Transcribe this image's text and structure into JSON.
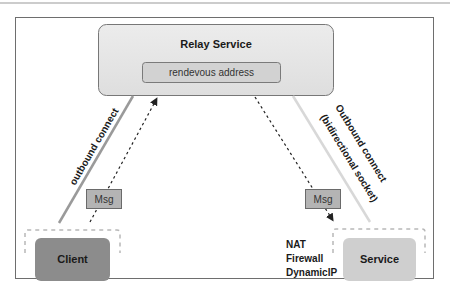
{
  "diagram": {
    "relay": {
      "title": "Relay Service",
      "inner_label": "rendevous address"
    },
    "left_connection": {
      "label": "outbound connect",
      "message_label": "Msg"
    },
    "right_connection": {
      "label_line1": "Outbound connect",
      "label_line2": "(bidirectional socket)",
      "message_label": "Msg"
    },
    "client": {
      "label": "Client"
    },
    "service": {
      "label": "Service",
      "constraints": [
        "NAT",
        "Firewall",
        "DynamicIP"
      ]
    },
    "colors": {
      "relay_fill": "#e4e4e4",
      "inner_fill": "#d2d2d2",
      "client_fill": "#8c8c8c",
      "service_fill": "#cfcfcf",
      "msg_fill": "#b4b4b4",
      "left_line": "#9a9a9a",
      "right_line": "#d8d8d8"
    }
  }
}
